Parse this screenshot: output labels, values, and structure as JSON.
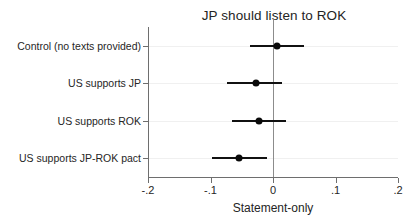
{
  "chart_data": {
    "type": "scatter",
    "title": "JP should listen to ROK",
    "xlabel": "Statement-only",
    "ylabel": "",
    "xlim": [
      -0.2,
      0.2
    ],
    "grid": true,
    "legend": null,
    "orientation": "horizontal",
    "zero_reference_line": 0,
    "xticks": [
      -0.2,
      -0.1,
      0,
      0.1,
      0.2
    ],
    "xticklabels": [
      "-.2",
      "-.1",
      "0",
      ".1",
      ".2"
    ],
    "categories": [
      "Control (no texts provided)",
      "US supports JP",
      "US supports ROK",
      "US supports JP-ROK pact"
    ],
    "values": [
      0.007,
      -0.027,
      -0.022,
      -0.054
    ],
    "ci_low": [
      -0.037,
      -0.073,
      -0.065,
      -0.098
    ],
    "ci_high": [
      0.05,
      0.015,
      0.021,
      -0.01
    ],
    "points": [
      {
        "category": "Control (no texts provided)",
        "estimate": 0.007,
        "ci_low": -0.037,
        "ci_high": 0.05
      },
      {
        "category": "US supports JP",
        "estimate": -0.027,
        "ci_low": -0.073,
        "ci_high": 0.015
      },
      {
        "category": "US supports ROK",
        "estimate": -0.022,
        "ci_low": -0.065,
        "ci_high": 0.021
      },
      {
        "category": "US supports JP-ROK pact",
        "estimate": -0.054,
        "ci_low": -0.098,
        "ci_high": -0.01
      }
    ]
  },
  "colors": {
    "marker": "#0a0a0a",
    "ci_bar": "#111111",
    "axis": "#6e6e6e",
    "zero_line": "#8c8c8c",
    "grid": "#f0f0f0",
    "background": "#ffffff",
    "text": "#242424"
  }
}
